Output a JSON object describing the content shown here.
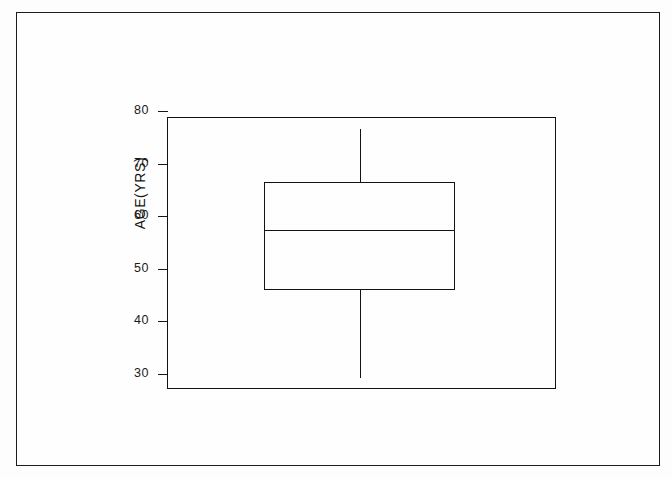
{
  "figure": {
    "background_color": "#fdfdfd",
    "line_color": "#131313",
    "border_color": "#1c1c1c"
  },
  "axis": {
    "y_title": "AGE(YRS)",
    "tick_labels": [
      "80",
      "70",
      "60",
      "50",
      "40",
      "30"
    ]
  },
  "chart_data": {
    "type": "box",
    "title": "",
    "xlabel": "",
    "ylabel": "AGE(YRS)",
    "ylim": [
      29,
      81.5
    ],
    "yticks": [
      30,
      40,
      50,
      60,
      70,
      80
    ],
    "ytick_labels": [
      "30",
      "40",
      "50",
      "60",
      "70",
      "80"
    ],
    "grid": false,
    "legend": null,
    "orientation": "vertical",
    "categories": [
      ""
    ],
    "boxes": [
      {
        "label": "",
        "min": 31.8,
        "q1": 48.5,
        "median": 59.8,
        "q3": 69.0,
        "max": 79.0,
        "outliers": [],
        "whisker_caps": false,
        "notch": false,
        "fill": "none"
      }
    ]
  }
}
